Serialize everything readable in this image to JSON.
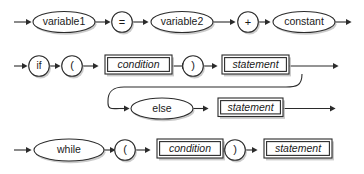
{
  "diagram": {
    "type": "railroad-syntax-diagram",
    "title": "",
    "background_color": "#ffffff",
    "line_color": "#2b2b2b",
    "shadow_color": "#b9b9b9",
    "node_fill": "#ffffff",
    "rows": [
      {
        "name": "assignment-expression",
        "nodes": [
          {
            "kind": "oval",
            "label": "variable1",
            "style": "terminal"
          },
          {
            "kind": "circle",
            "label": "=",
            "style": "operator"
          },
          {
            "kind": "oval",
            "label": "variable2",
            "style": "terminal"
          },
          {
            "kind": "circle",
            "label": "+",
            "style": "operator"
          },
          {
            "kind": "oval",
            "label": "constant",
            "style": "terminal"
          }
        ]
      },
      {
        "name": "if-statement",
        "nodes": [
          {
            "kind": "circle",
            "label": "if",
            "style": "terminal"
          },
          {
            "kind": "circle",
            "label": "(",
            "style": "operator"
          },
          {
            "kind": "box",
            "label": "condition",
            "style": "nonterminal"
          },
          {
            "kind": "circle",
            "label": ")",
            "style": "operator"
          },
          {
            "kind": "box",
            "label": "statement",
            "style": "nonterminal"
          }
        ],
        "branch": {
          "name": "else-branch",
          "nodes": [
            {
              "kind": "oval",
              "label": "else",
              "style": "terminal"
            },
            {
              "kind": "box",
              "label": "statement",
              "style": "nonterminal"
            }
          ]
        }
      },
      {
        "name": "while-statement",
        "nodes": [
          {
            "kind": "oval",
            "label": "while",
            "style": "terminal"
          },
          {
            "kind": "circle",
            "label": "(",
            "style": "operator"
          },
          {
            "kind": "box",
            "label": "condition",
            "style": "nonterminal"
          },
          {
            "kind": "circle",
            "label": ")",
            "style": "operator"
          },
          {
            "kind": "box",
            "label": "statement",
            "style": "nonterminal"
          }
        ]
      }
    ],
    "labels": {
      "r1_n1": "variable1",
      "r1_n2": "=",
      "r1_n3": "variable2",
      "r1_n4": "+",
      "r1_n5": "constant",
      "r2_n1": "if",
      "r2_n2": "(",
      "r2_n3": "condition",
      "r2_n4": ")",
      "r2_n5": "statement",
      "r2_b1": "else",
      "r2_b2": "statement",
      "r3_n1": "while",
      "r3_n2": "(",
      "r3_n3": "condition",
      "r3_n4": ")",
      "r3_n5": "statement"
    }
  }
}
